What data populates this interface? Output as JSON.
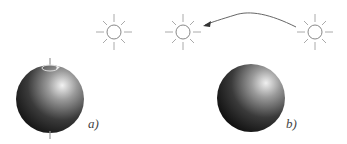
{
  "panels": [
    {
      "label": "a)",
      "description": "rotating sphere with axis and rotation arrow, single light source"
    },
    {
      "label": "b)",
      "description": "stationary sphere, light source moving from right to left"
    }
  ],
  "colors": {
    "sphere_dark": "#111111",
    "sphere_highlight": "#f2f2f2",
    "line": "#888888"
  }
}
